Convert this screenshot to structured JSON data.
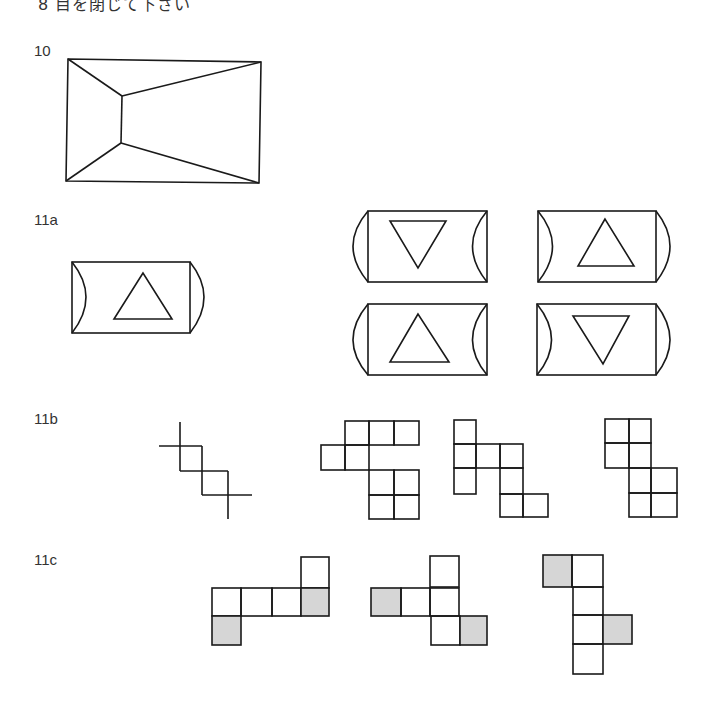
{
  "header": {
    "text": "8  目を閉じて下さい"
  },
  "items": [
    {
      "id": "10",
      "label": "10"
    },
    {
      "id": "11a",
      "label": "11a"
    },
    {
      "id": "11b",
      "label": "11b"
    },
    {
      "id": "11c",
      "label": "11c"
    }
  ],
  "colors": {
    "stroke": "#1a1a1a",
    "shade": "#d6d6d6",
    "background": "#ffffff"
  },
  "figures": {
    "item10": "rectangle-with-receding-inner-lines",
    "item11a": {
      "model": "rounded-tab with up triangle",
      "options": [
        "down-triangle",
        "up-triangle",
        "up-triangle",
        "down-triangle"
      ]
    },
    "item11b": {
      "model": "staircase cross grid",
      "options": [
        "polyomino-A",
        "polyomino-B",
        "polyomino-C"
      ]
    },
    "item11c": {
      "options": [
        "net-A shaded 2",
        "net-B shaded 2",
        "net-C shaded 2"
      ]
    }
  }
}
